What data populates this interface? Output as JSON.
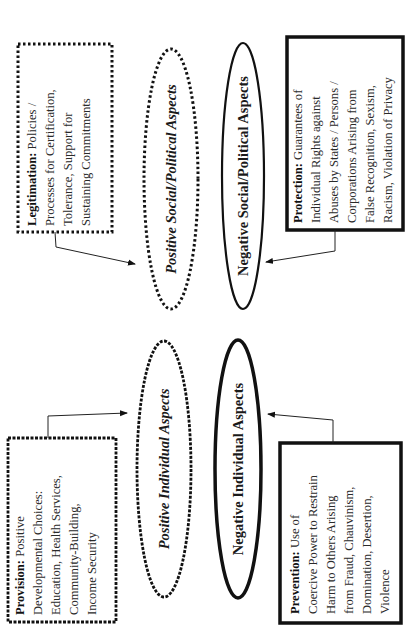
{
  "diagram": {
    "orientation": "rotated-90-ccw",
    "colors": {
      "stroke": "#111111",
      "text": "#1a1a1a",
      "background": "#ffffff"
    },
    "boxes": [
      {
        "id": "legitimation",
        "lead": "Legitimation:",
        "lines": [
          " Policies /",
          "Processes for Certification,",
          "Tolerance, Support for",
          "Sustaining Commitments"
        ],
        "border": "dotted",
        "target": "positive-social-political"
      },
      {
        "id": "protection",
        "lead": "Protection:",
        "lines": [
          " Guarantees of",
          "Individual Rights against",
          "Abuses by States / Persons /",
          "Corporations Arising from",
          "False Recognition, Sexism,",
          "Racism, Violation of Privacy"
        ],
        "border": "thick-solid",
        "target": "negative-social-political"
      },
      {
        "id": "provision",
        "lead": "Provision:",
        "lines": [
          " Positive",
          "Developmental Choices:",
          "Education, Health Services,",
          "Community-Building,",
          "Income Security"
        ],
        "border": "wavy-dashed",
        "target": "positive-individual"
      },
      {
        "id": "prevention",
        "lead": "Prevention:",
        "lines": [
          " Use of",
          "Coercive Power to Restrain",
          "Harm to Others Arising",
          "from Fraud, Chauvinism,",
          "Domination, Desertion,",
          "Violence"
        ],
        "border": "thick-solid",
        "target": "negative-individual"
      }
    ],
    "ellipses": [
      {
        "id": "positive-social-political",
        "label": "Positive Social/Political Aspects",
        "style": "dotted-italic"
      },
      {
        "id": "negative-social-political",
        "label": "Negative Social/Political Aspects",
        "style": "solid-bold"
      },
      {
        "id": "positive-individual",
        "label": "Positive Individual Aspects",
        "style": "wavy-italic"
      },
      {
        "id": "negative-individual",
        "label": "Negative Individual Aspects",
        "style": "thick-solid-bold"
      }
    ]
  }
}
